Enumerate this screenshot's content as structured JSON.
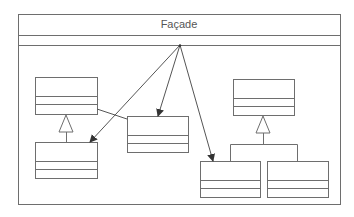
{
  "diagram": {
    "title": "Façade",
    "type": "UML class diagram",
    "colors": {
      "line": "#6e6e6e",
      "arrow": "#333333",
      "text": "#555555",
      "background": "#ffffff"
    },
    "facade": {
      "x": 18,
      "y": 14,
      "w": 322,
      "h": 190,
      "header_bottom": 35,
      "divider": 45,
      "arrow_origin": [
        180,
        45
      ]
    },
    "classes": [
      {
        "id": "left-parent",
        "x": 35,
        "y": 77,
        "w": 62,
        "h": 37,
        "d1": 19,
        "d2": 27
      },
      {
        "id": "left-child",
        "x": 35,
        "y": 142,
        "w": 62,
        "h": 36,
        "d1": 19,
        "d2": 27
      },
      {
        "id": "middle",
        "x": 127,
        "y": 116,
        "w": 61,
        "h": 36,
        "d1": 19,
        "d2": 27
      },
      {
        "id": "right-parent",
        "x": 233,
        "y": 79,
        "w": 61,
        "h": 36,
        "d1": 19,
        "d2": 27
      },
      {
        "id": "right-child-a",
        "x": 200,
        "y": 161,
        "w": 60,
        "h": 36,
        "d1": 19,
        "d2": 27
      },
      {
        "id": "right-child-b",
        "x": 267,
        "y": 161,
        "w": 61,
        "h": 36,
        "d1": 19,
        "d2": 27
      }
    ],
    "arrows": [
      {
        "from": [
          180,
          45
        ],
        "to": [
          90,
          142
        ]
      },
      {
        "from": [
          180,
          45
        ],
        "to": [
          158,
          116
        ]
      },
      {
        "from": [
          180,
          45
        ],
        "to": [
          213,
          161
        ]
      }
    ],
    "associations": [
      {
        "from": [
          97,
          109
        ],
        "to": [
          127,
          119
        ]
      }
    ],
    "generalizations": [
      {
        "parent_apex": [
          66,
          114
        ],
        "base_y": 132,
        "stem_to": [
          66,
          142
        ]
      },
      {
        "parent_apex": [
          263,
          115
        ],
        "base_y": 133,
        "bar_y": 144,
        "bar_x": [
          230,
          297
        ],
        "children_top": 161
      }
    ]
  }
}
